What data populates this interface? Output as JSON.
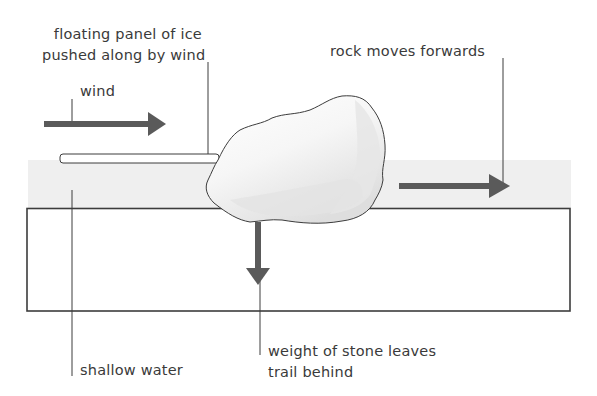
{
  "diagram": {
    "title": "",
    "labels": {
      "ice_panel_line1": "floating panel of ice",
      "ice_panel_line2": "pushed along by wind",
      "wind": "wind",
      "rock_moves": "rock moves forwards",
      "shallow_water": "shallow water",
      "weight_line1": "weight of stone leaves",
      "weight_line2": "trail behind"
    },
    "colors": {
      "arrow": "#5a5a5a",
      "outline": "#3c3c3c",
      "water": "#efefef",
      "rock_light": "#fafafa",
      "rock_shade": "#e2e2e2",
      "text": "#3a3a3a"
    },
    "elements": [
      {
        "id": "wind-arrow",
        "direction": "right"
      },
      {
        "id": "ice-panel",
        "kind": "floating panel of ice"
      },
      {
        "id": "rock",
        "kind": "boulder"
      },
      {
        "id": "rock-forward-arrow",
        "direction": "right"
      },
      {
        "id": "weight-arrow",
        "direction": "down"
      },
      {
        "id": "shallow-water-layer"
      },
      {
        "id": "lake-bed"
      }
    ]
  }
}
